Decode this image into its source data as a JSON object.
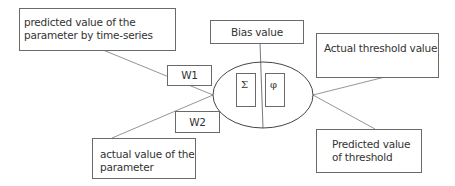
{
  "diagram": {
    "inputs": {
      "predicted_param": {
        "label": "predicted value of the parameter by time-series"
      },
      "actual_param": {
        "label": "actual value of the parameter"
      }
    },
    "weights": {
      "w1": {
        "label": "W1"
      },
      "w2": {
        "label": "W2"
      }
    },
    "bias": {
      "label": "Bias value"
    },
    "neuron": {
      "sum_symbol": "Σ",
      "activation_symbol": "φ"
    },
    "outputs": {
      "actual_threshold": {
        "label": "Actual threshold value"
      },
      "predicted_threshold": {
        "label": "Predicted value of threshold"
      }
    },
    "colors": {
      "stroke": "#6a6a6a",
      "text": "#333333",
      "background": "#ffffff"
    }
  }
}
